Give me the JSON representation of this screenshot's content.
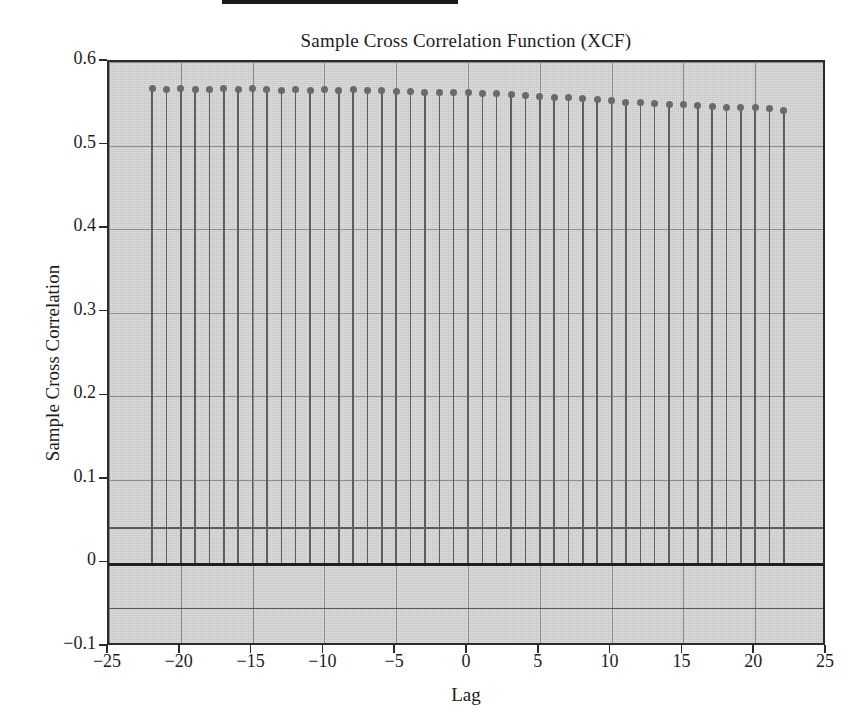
{
  "figure": {
    "title": "Sample Cross Correlation Function (XCF)",
    "top_rule": true
  },
  "axes": {
    "xlabel": "Lag",
    "ylabel": "Sample Cross Correlation",
    "xticks": [
      "-25",
      "-20",
      "-15",
      "-10",
      "-5",
      "0",
      "5",
      "10",
      "15",
      "20",
      "25"
    ],
    "yticks": [
      "0.6",
      "0.5",
      "0.4",
      "0.3",
      "0.2",
      "0.1",
      "0",
      "-0.1"
    ]
  },
  "colors": {
    "plot_background": "#d2d2d2",
    "axis": "#2b2b2b",
    "grid": "#8d8d8d",
    "stem": "#5e5e5e",
    "marker": "#6a6a6a",
    "zero_line": "#1f1f1f",
    "bound_line": "#5a5a5a",
    "text": "#1c1c1c"
  },
  "chart_data": {
    "type": "line",
    "plot_style": "stem",
    "title": "Sample Cross Correlation Function (XCF)",
    "xlabel": "Lag",
    "ylabel": "Sample Cross Correlation",
    "xlim": [
      -25,
      25
    ],
    "ylim": [
      -0.1,
      0.6
    ],
    "xticks": [
      -25,
      -20,
      -15,
      -10,
      -5,
      0,
      5,
      10,
      15,
      20,
      25
    ],
    "yticks": [
      0.6,
      0.5,
      0.4,
      0.3,
      0.2,
      0.1,
      0,
      -0.1
    ],
    "grid": true,
    "legend": null,
    "confidence_bounds": {
      "upper": 0.043,
      "lower": -0.053,
      "zero": 0
    },
    "x": [
      -22,
      -21,
      -20,
      -19,
      -18,
      -17,
      -16,
      -15,
      -14,
      -13,
      -12,
      -11,
      -10,
      -9,
      -8,
      -7,
      -6,
      -5,
      -4,
      -3,
      -2,
      -1,
      0,
      1,
      2,
      3,
      4,
      5,
      6,
      7,
      8,
      9,
      10,
      11,
      12,
      13,
      14,
      15,
      16,
      17,
      18,
      19,
      20,
      21,
      22
    ],
    "values": [
      0.568,
      0.567,
      0.568,
      0.567,
      0.567,
      0.568,
      0.567,
      0.568,
      0.567,
      0.566,
      0.567,
      0.566,
      0.567,
      0.566,
      0.567,
      0.566,
      0.566,
      0.565,
      0.565,
      0.564,
      0.564,
      0.563,
      0.563,
      0.562,
      0.562,
      0.561,
      0.56,
      0.559,
      0.558,
      0.557,
      0.556,
      0.555,
      0.554,
      0.552,
      0.551,
      0.55,
      0.549,
      0.549,
      0.548,
      0.547,
      0.546,
      0.545,
      0.545,
      0.544,
      0.542
    ]
  }
}
